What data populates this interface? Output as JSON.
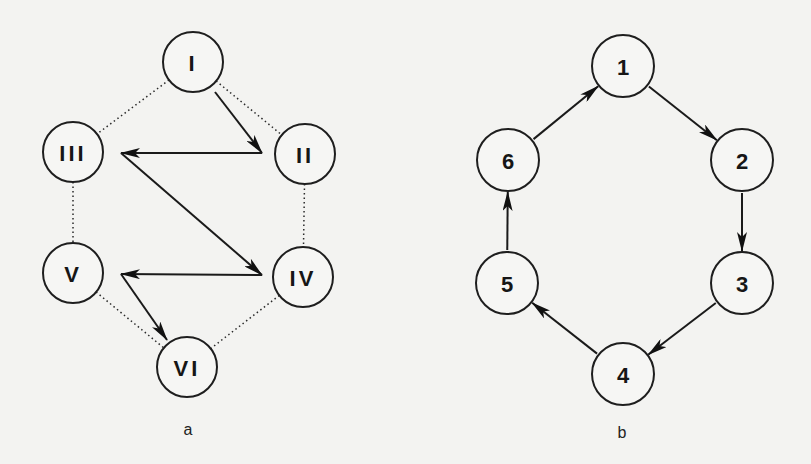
{
  "diagram_a": {
    "caption": "a",
    "nodes": [
      {
        "id": "I",
        "label": "I",
        "cx": 193,
        "cy": 62,
        "r": 30
      },
      {
        "id": "II",
        "label": "II",
        "cx": 305,
        "cy": 154,
        "r": 30
      },
      {
        "id": "III",
        "label": "III",
        "cx": 73,
        "cy": 152,
        "r": 30
      },
      {
        "id": "IV",
        "label": "IV",
        "cx": 303,
        "cy": 277,
        "r": 30
      },
      {
        "id": "V",
        "label": "V",
        "cx": 73,
        "cy": 273,
        "r": 30
      },
      {
        "id": "VI",
        "label": "VI",
        "cx": 187,
        "cy": 367,
        "r": 30
      }
    ],
    "dotted_edges": [
      {
        "from": "I",
        "to": "III"
      },
      {
        "from": "I",
        "to": "II"
      },
      {
        "from": "III",
        "to": "V"
      },
      {
        "from": "II",
        "to": "IV"
      },
      {
        "from": "V",
        "to": "VI"
      },
      {
        "from": "IV",
        "to": "VI"
      }
    ],
    "arrow_path": [
      {
        "x1": 215,
        "y1": 92,
        "x2": 262,
        "y2": 153
      },
      {
        "x1": 262,
        "y1": 153,
        "x2": 121,
        "y2": 153
      },
      {
        "x1": 121,
        "y1": 153,
        "x2": 262,
        "y2": 275
      },
      {
        "x1": 262,
        "y1": 275,
        "x2": 121,
        "y2": 274
      },
      {
        "x1": 121,
        "y1": 274,
        "x2": 167,
        "y2": 340
      }
    ]
  },
  "diagram_b": {
    "caption": "b",
    "nodes": [
      {
        "id": "1",
        "label": "1",
        "cx": 623,
        "cy": 66,
        "r": 31
      },
      {
        "id": "2",
        "label": "2",
        "cx": 742,
        "cy": 160,
        "r": 31
      },
      {
        "id": "3",
        "label": "3",
        "cx": 742,
        "cy": 283,
        "r": 31
      },
      {
        "id": "4",
        "label": "4",
        "cx": 623,
        "cy": 374,
        "r": 31
      },
      {
        "id": "5",
        "label": "5",
        "cx": 507,
        "cy": 283,
        "r": 31
      },
      {
        "id": "6",
        "label": "6",
        "cx": 508,
        "cy": 160,
        "r": 31
      }
    ],
    "arrows": [
      {
        "from": "1",
        "to": "2"
      },
      {
        "from": "2",
        "to": "3"
      },
      {
        "from": "3",
        "to": "4"
      },
      {
        "from": "4",
        "to": "5"
      },
      {
        "from": "5",
        "to": "6"
      },
      {
        "from": "6",
        "to": "1"
      }
    ]
  },
  "captions": {
    "a": {
      "text": "a",
      "x": 188,
      "y": 429
    },
    "b": {
      "text": "b",
      "x": 622,
      "y": 432
    }
  }
}
